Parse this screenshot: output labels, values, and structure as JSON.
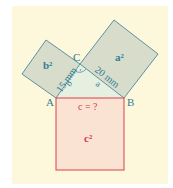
{
  "diagram": {
    "colors": {
      "background": "#fdf8dc",
      "leg_square_fill": "#d8dccb",
      "leg_square_stroke": "#5a93a3",
      "leg_label": "#2f7f96",
      "hyp_square_fill": "#fbe3d4",
      "hyp_square_stroke": "#d9404a",
      "hyp_label": "#d43c44",
      "vertex_label": "#2f7f96",
      "triangle_fill": "#e6f0e0"
    },
    "vertices": {
      "A": "A",
      "B": "B",
      "C": "C"
    },
    "squares": {
      "b_sq": "b²",
      "a_sq": "a²",
      "c_sq": "c²"
    },
    "sides": {
      "b": "b",
      "a": "a",
      "b_length": "15 mm",
      "a_length": "20 mm",
      "c_question": "c = ?"
    }
  }
}
